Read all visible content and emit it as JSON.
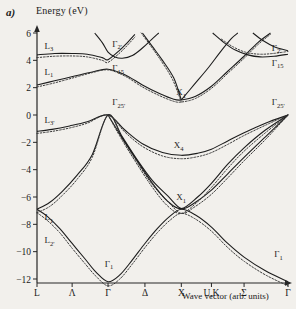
{
  "figure": {
    "panel_label": "a)",
    "y_axis_title": "Energy (eV)",
    "x_axis_title": "Wave vector (arb. units)"
  },
  "chart_data": {
    "type": "line",
    "title": "Energy (eV)",
    "xlabel": "Wave vector (arb. units)",
    "ylabel": "Energy (eV)",
    "ylim": [
      -12,
      6
    ],
    "grid": false,
    "legend": "none",
    "y_ticks": [
      6,
      4,
      2,
      0,
      -2,
      -4,
      -6,
      -8,
      -10,
      -12
    ],
    "y_tick_labels": [
      "6",
      "4",
      "2",
      "0",
      "-2",
      "-4",
      "-6",
      "-8",
      "-10",
      "-12"
    ],
    "x_tick_labels": [
      "L",
      "Λ",
      "Γ",
      "Δ",
      "X",
      "U,K",
      "Σ",
      "Γ"
    ],
    "x_symmetry_points": [
      {
        "label": "L",
        "x": 0.0
      },
      {
        "label": "Λ",
        "x": 0.14
      },
      {
        "label": "Γ",
        "x": 0.283
      },
      {
        "label": "Δ",
        "x": 0.43
      },
      {
        "label": "X",
        "x": 0.575
      },
      {
        "label": "U,K",
        "x": 0.695
      },
      {
        "label": "Σ",
        "x": 0.825
      },
      {
        "label": "Γ",
        "x": 1.0
      }
    ],
    "band_labels": [
      {
        "text": "L",
        "sub": "3",
        "x": 0.03,
        "y": 4.85
      },
      {
        "text": "L",
        "sub": "1",
        "x": 0.03,
        "y": 2.95
      },
      {
        "text": "L",
        "sub": "3'",
        "x": 0.03,
        "y": -0.55
      },
      {
        "text": "L",
        "sub": "1",
        "x": 0.03,
        "y": -7.7
      },
      {
        "text": "L",
        "sub": "2'",
        "x": 0.03,
        "y": -9.4
      },
      {
        "text": "Γ",
        "sub": "2'",
        "x": 0.3,
        "y": 5.0
      },
      {
        "text": "Γ",
        "sub": "15",
        "x": 0.3,
        "y": 3.2
      },
      {
        "text": "Γ",
        "sub": "25'",
        "x": 0.3,
        "y": 0.7
      },
      {
        "text": "Γ",
        "sub": "1",
        "x": 0.27,
        "y": -11.1
      },
      {
        "text": "X",
        "sub": "1",
        "x": 0.555,
        "y": 1.45
      },
      {
        "text": "X",
        "sub": "4",
        "x": 0.545,
        "y": -2.45
      },
      {
        "text": "X",
        "sub": "1",
        "x": 0.555,
        "y": -6.25
      },
      {
        "text": "Γ",
        "sub": "2'",
        "x": 0.935,
        "y": 4.7
      },
      {
        "text": "Γ",
        "sub": "15",
        "x": 0.935,
        "y": 3.6
      },
      {
        "text": "Γ",
        "sub": "25'",
        "x": 0.935,
        "y": 0.7
      },
      {
        "text": "Γ",
        "sub": "1",
        "x": 0.945,
        "y": -10.4
      }
    ],
    "series": [
      {
        "name": "band-1-lowest-valence",
        "style": "solid",
        "points": [
          [
            0.0,
            -6.9
          ],
          [
            0.04,
            -7.4
          ],
          [
            0.09,
            -8.3
          ],
          [
            0.14,
            -9.4
          ],
          [
            0.19,
            -10.5
          ],
          [
            0.235,
            -11.5
          ],
          [
            0.283,
            -12.2
          ],
          [
            0.33,
            -11.7
          ],
          [
            0.38,
            -10.6
          ],
          [
            0.43,
            -9.4
          ],
          [
            0.48,
            -8.3
          ],
          [
            0.53,
            -7.4
          ],
          [
            0.575,
            -6.9
          ],
          [
            0.63,
            -7.3
          ],
          [
            0.695,
            -8.2
          ],
          [
            0.76,
            -9.4
          ],
          [
            0.825,
            -10.4
          ],
          [
            0.91,
            -11.4
          ],
          [
            1.0,
            -12.2
          ]
        ]
      },
      {
        "name": "band-1-lowest-valence-dotted",
        "style": "dotted",
        "points": [
          [
            0.0,
            -7.15
          ],
          [
            0.04,
            -7.7
          ],
          [
            0.09,
            -8.6
          ],
          [
            0.14,
            -9.75
          ],
          [
            0.19,
            -10.85
          ],
          [
            0.235,
            -11.8
          ],
          [
            0.283,
            -12.5
          ],
          [
            0.33,
            -12.0
          ],
          [
            0.38,
            -10.9
          ],
          [
            0.43,
            -9.7
          ],
          [
            0.48,
            -8.6
          ],
          [
            0.53,
            -7.7
          ],
          [
            0.575,
            -7.2
          ],
          [
            0.63,
            -7.6
          ],
          [
            0.695,
            -8.5
          ],
          [
            0.76,
            -9.7
          ],
          [
            0.825,
            -10.7
          ],
          [
            0.91,
            -11.7
          ],
          [
            1.0,
            -12.5
          ]
        ]
      },
      {
        "name": "band-2-valence",
        "style": "solid",
        "points": [
          [
            0.0,
            -6.9
          ],
          [
            0.05,
            -6.4
          ],
          [
            0.1,
            -5.6
          ],
          [
            0.16,
            -4.4
          ],
          [
            0.22,
            -2.9
          ],
          [
            0.283,
            0.0
          ],
          [
            0.34,
            -1.6
          ],
          [
            0.4,
            -3.3
          ],
          [
            0.46,
            -4.8
          ],
          [
            0.52,
            -5.9
          ],
          [
            0.575,
            -6.85
          ],
          [
            0.63,
            -6.4
          ],
          [
            0.695,
            -5.5
          ],
          [
            0.76,
            -4.3
          ],
          [
            0.825,
            -3.1
          ],
          [
            0.91,
            -1.6
          ],
          [
            1.0,
            0.0
          ]
        ]
      },
      {
        "name": "band-2-valence-dotted",
        "style": "dotted",
        "points": [
          [
            0.0,
            -7.15
          ],
          [
            0.05,
            -6.7
          ],
          [
            0.1,
            -5.9
          ],
          [
            0.16,
            -4.7
          ],
          [
            0.22,
            -3.1
          ],
          [
            0.283,
            0.0
          ],
          [
            0.34,
            -1.75
          ],
          [
            0.4,
            -3.5
          ],
          [
            0.46,
            -5.1
          ],
          [
            0.52,
            -6.3
          ],
          [
            0.575,
            -7.2
          ],
          [
            0.63,
            -6.7
          ],
          [
            0.695,
            -5.8
          ],
          [
            0.76,
            -4.6
          ],
          [
            0.825,
            -3.35
          ],
          [
            0.91,
            -1.8
          ],
          [
            1.0,
            0.0
          ]
        ]
      },
      {
        "name": "band-3-valence",
        "style": "solid",
        "points": [
          [
            0.0,
            -1.2
          ],
          [
            0.06,
            -1.05
          ],
          [
            0.13,
            -0.8
          ],
          [
            0.2,
            -0.5
          ],
          [
            0.283,
            0.0
          ],
          [
            0.35,
            -1.1
          ],
          [
            0.42,
            -2.1
          ],
          [
            0.5,
            -2.75
          ],
          [
            0.575,
            -2.95
          ],
          [
            0.64,
            -2.8
          ],
          [
            0.695,
            -2.5
          ],
          [
            0.76,
            -1.9
          ],
          [
            0.825,
            -1.3
          ],
          [
            0.91,
            -0.6
          ],
          [
            1.0,
            0.0
          ]
        ]
      },
      {
        "name": "band-3-valence-dotted",
        "style": "dotted",
        "points": [
          [
            0.0,
            -1.35
          ],
          [
            0.06,
            -1.2
          ],
          [
            0.13,
            -0.95
          ],
          [
            0.2,
            -0.6
          ],
          [
            0.283,
            0.0
          ],
          [
            0.35,
            -1.25
          ],
          [
            0.42,
            -2.3
          ],
          [
            0.5,
            -3.0
          ],
          [
            0.575,
            -3.2
          ],
          [
            0.64,
            -3.05
          ],
          [
            0.695,
            -2.75
          ],
          [
            0.76,
            -2.15
          ],
          [
            0.825,
            -1.5
          ],
          [
            0.91,
            -0.75
          ],
          [
            1.0,
            0.0
          ]
        ]
      },
      {
        "name": "band-4-valence-light-hole",
        "style": "solid",
        "points": [
          [
            0.283,
            0.0
          ],
          [
            0.33,
            -1.4
          ],
          [
            0.39,
            -3.1
          ],
          [
            0.46,
            -5.0
          ],
          [
            0.52,
            -6.3
          ],
          [
            0.575,
            -6.85
          ],
          [
            0.64,
            -6.0
          ],
          [
            0.695,
            -5.0
          ],
          [
            0.76,
            -3.6
          ],
          [
            0.825,
            -2.4
          ],
          [
            0.91,
            -1.1
          ],
          [
            1.0,
            0.0
          ]
        ]
      },
      {
        "name": "band-4-valence-light-hole-dotted",
        "style": "dotted",
        "points": [
          [
            0.283,
            0.0
          ],
          [
            0.33,
            -1.55
          ],
          [
            0.39,
            -3.35
          ],
          [
            0.46,
            -5.3
          ],
          [
            0.52,
            -6.65
          ],
          [
            0.575,
            -7.2
          ],
          [
            0.64,
            -6.35
          ],
          [
            0.695,
            -5.3
          ],
          [
            0.76,
            -3.9
          ],
          [
            0.825,
            -2.65
          ],
          [
            0.91,
            -1.3
          ],
          [
            1.0,
            0.0
          ]
        ]
      },
      {
        "name": "band-5-conduction-lowest",
        "style": "solid",
        "points": [
          [
            0.0,
            2.2
          ],
          [
            0.07,
            2.5
          ],
          [
            0.15,
            2.85
          ],
          [
            0.22,
            3.15
          ],
          [
            0.283,
            3.35
          ],
          [
            0.35,
            2.95
          ],
          [
            0.42,
            2.2
          ],
          [
            0.49,
            1.55
          ],
          [
            0.545,
            1.15
          ],
          [
            0.575,
            1.1
          ],
          [
            0.63,
            1.35
          ],
          [
            0.695,
            2.1
          ],
          [
            0.76,
            3.2
          ],
          [
            0.825,
            4.3
          ],
          [
            0.88,
            5.3
          ],
          [
            0.93,
            6.0
          ]
        ]
      },
      {
        "name": "band-5-conduction-lowest-dotted",
        "style": "dotted",
        "points": [
          [
            0.0,
            2.05
          ],
          [
            0.07,
            2.35
          ],
          [
            0.15,
            2.75
          ],
          [
            0.22,
            3.1
          ],
          [
            0.283,
            3.3
          ],
          [
            0.35,
            2.85
          ],
          [
            0.42,
            2.05
          ],
          [
            0.49,
            1.4
          ],
          [
            0.545,
            1.0
          ],
          [
            0.575,
            0.95
          ],
          [
            0.63,
            1.2
          ],
          [
            0.695,
            1.95
          ],
          [
            0.76,
            3.05
          ],
          [
            0.825,
            4.15
          ],
          [
            0.88,
            5.15
          ],
          [
            0.93,
            5.9
          ]
        ]
      },
      {
        "name": "band-6-conduction-L3",
        "style": "solid",
        "points": [
          [
            0.0,
            4.4
          ],
          [
            0.07,
            4.5
          ],
          [
            0.14,
            4.5
          ],
          [
            0.2,
            4.45
          ],
          [
            0.26,
            4.2
          ],
          [
            0.283,
            4.05
          ],
          [
            0.33,
            4.75
          ],
          [
            0.36,
            5.3
          ],
          [
            0.39,
            5.9
          ]
        ]
      },
      {
        "name": "band-6-conduction-L3-dotted",
        "style": "dotted",
        "points": [
          [
            0.0,
            4.2
          ],
          [
            0.07,
            4.3
          ],
          [
            0.14,
            4.32
          ],
          [
            0.2,
            4.25
          ],
          [
            0.26,
            4.0
          ],
          [
            0.283,
            3.85
          ],
          [
            0.33,
            4.55
          ],
          [
            0.36,
            5.1
          ],
          [
            0.39,
            5.7
          ]
        ]
      },
      {
        "name": "band-7-conduction-gamma2p",
        "style": "solid",
        "points": [
          [
            0.23,
            6.0
          ],
          [
            0.26,
            5.3
          ],
          [
            0.283,
            4.6
          ],
          [
            0.31,
            4.25
          ],
          [
            0.34,
            4.15
          ],
          [
            0.38,
            4.35
          ],
          [
            0.42,
            4.9
          ],
          [
            0.455,
            5.5
          ],
          [
            0.485,
            6.0
          ]
        ]
      },
      {
        "name": "band-8-conduction-right",
        "style": "solid",
        "points": [
          [
            0.7,
            6.0
          ],
          [
            0.745,
            5.3
          ],
          [
            0.79,
            4.75
          ],
          [
            0.84,
            4.4
          ],
          [
            0.89,
            4.25
          ],
          [
            0.945,
            4.3
          ],
          [
            1.0,
            4.45
          ]
        ]
      },
      {
        "name": "band-8-conduction-right-dotted",
        "style": "dotted",
        "points": [
          [
            0.735,
            5.55
          ],
          [
            0.78,
            5.0
          ],
          [
            0.83,
            4.6
          ],
          [
            0.885,
            4.45
          ],
          [
            0.94,
            4.5
          ],
          [
            1.0,
            4.65
          ]
        ]
      },
      {
        "name": "band-9-conduction-upper-right",
        "style": "solid",
        "points": [
          [
            0.86,
            6.0
          ],
          [
            0.9,
            5.45
          ],
          [
            0.945,
            5.0
          ],
          [
            1.0,
            4.7
          ]
        ]
      },
      {
        "name": "band-10-conduction-x1-upper",
        "style": "solid",
        "points": [
          [
            0.42,
            6.0
          ],
          [
            0.46,
            5.0
          ],
          [
            0.5,
            4.0
          ],
          [
            0.545,
            2.7
          ],
          [
            0.575,
            1.1
          ]
        ]
      },
      {
        "name": "band-10-conduction-x1-upper-dotted",
        "style": "dotted",
        "points": [
          [
            0.415,
            6.0
          ],
          [
            0.455,
            5.0
          ],
          [
            0.495,
            3.95
          ],
          [
            0.54,
            2.6
          ],
          [
            0.575,
            0.95
          ]
        ]
      },
      {
        "name": "band-11-conduction-right-branch",
        "style": "solid",
        "points": [
          [
            0.575,
            1.1
          ],
          [
            0.625,
            2.2
          ],
          [
            0.68,
            3.4
          ],
          [
            0.73,
            4.6
          ],
          [
            0.775,
            5.6
          ],
          [
            0.8,
            6.0
          ]
        ]
      }
    ]
  }
}
